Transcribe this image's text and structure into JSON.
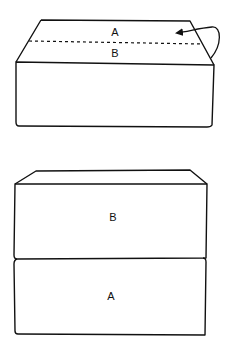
{
  "diagram": {
    "step1": {
      "label_top": "A",
      "label_bottom": "B",
      "fold_line": "dashed",
      "arrow": "curved fold arrow from right edge pointing back onto A"
    },
    "step2": {
      "label_upper_box": "B",
      "label_lower_box": "A"
    },
    "colors": {
      "stroke": "#111111",
      "background": "#ffffff"
    }
  }
}
